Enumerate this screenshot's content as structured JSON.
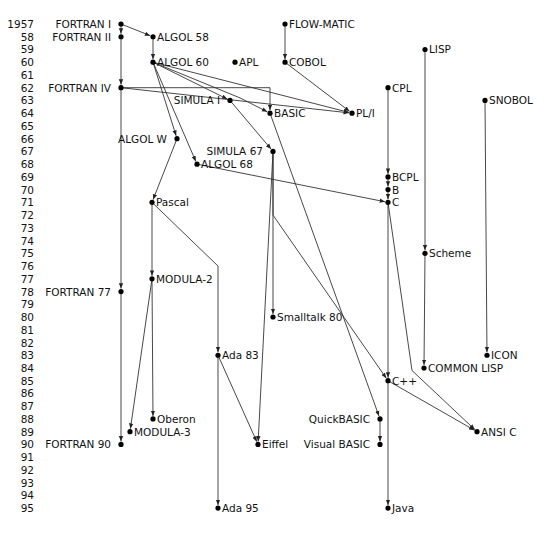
{
  "years": [
    "1957",
    "58",
    "59",
    "60",
    "61",
    "62",
    "63",
    "64",
    "65",
    "66",
    "67",
    "68",
    "69",
    "70",
    "71",
    "72",
    "73",
    "74",
    "75",
    "76",
    "77",
    "78",
    "79",
    "80",
    "81",
    "82",
    "83",
    "84",
    "85",
    "86",
    "87",
    "88",
    "89",
    "90",
    "91",
    "92",
    "93",
    "94",
    "95"
  ],
  "languages": [
    {
      "id": "fortran1",
      "name": "FORTRAN I",
      "year": 1957,
      "label_side": "left"
    },
    {
      "id": "fortran2",
      "name": "FORTRAN II",
      "year": 1958,
      "label_side": "left"
    },
    {
      "id": "algol58",
      "name": "ALGOL 58",
      "year": 1958,
      "label_side": "right"
    },
    {
      "id": "flowmatic",
      "name": "FLOW-MATIC",
      "year": 1957,
      "label_side": "right"
    },
    {
      "id": "lisp",
      "name": "LISP",
      "year": 1959,
      "label_side": "right"
    },
    {
      "id": "algol60",
      "name": "ALGOL 60",
      "year": 1960,
      "label_side": "right"
    },
    {
      "id": "apl",
      "name": "APL",
      "year": 1960,
      "label_side": "right"
    },
    {
      "id": "cobol",
      "name": "COBOL",
      "year": 1960,
      "label_side": "right"
    },
    {
      "id": "fortran4",
      "name": "FORTRAN IV",
      "year": 1962,
      "label_side": "left"
    },
    {
      "id": "cpl",
      "name": "CPL",
      "year": 1962,
      "label_side": "right"
    },
    {
      "id": "simula1",
      "name": "SIMULA I",
      "year": 1963,
      "label_side": "left"
    },
    {
      "id": "snobol",
      "name": "SNOBOL",
      "year": 1963,
      "label_side": "right"
    },
    {
      "id": "basic",
      "name": "BASIC",
      "year": 1964,
      "label_side": "right"
    },
    {
      "id": "pl1",
      "name": "PL/I",
      "year": 1964,
      "label_side": "right"
    },
    {
      "id": "algolw",
      "name": "ALGOL W",
      "year": 1966,
      "label_side": "left"
    },
    {
      "id": "simula67",
      "name": "SIMULA 67",
      "year": 1967,
      "label_side": "left"
    },
    {
      "id": "algol68",
      "name": "ALGOL 68",
      "year": 1968,
      "label_side": "right"
    },
    {
      "id": "bcpl",
      "name": "BCPL",
      "year": 1969,
      "label_side": "right"
    },
    {
      "id": "b",
      "name": "B",
      "year": 1970,
      "label_side": "right"
    },
    {
      "id": "c",
      "name": "C",
      "year": 1971,
      "label_side": "right"
    },
    {
      "id": "pascal",
      "name": "Pascal",
      "year": 1971,
      "label_side": "right"
    },
    {
      "id": "scheme",
      "name": "Scheme",
      "year": 1975,
      "label_side": "right"
    },
    {
      "id": "modula2",
      "name": "MODULA-2",
      "year": 1977,
      "label_side": "right"
    },
    {
      "id": "fortran77",
      "name": "FORTRAN 77",
      "year": 1978,
      "label_side": "left"
    },
    {
      "id": "smalltalk80",
      "name": "Smalltalk 80",
      "year": 1980,
      "label_side": "right"
    },
    {
      "id": "ada83",
      "name": "Ada 83",
      "year": 1983,
      "label_side": "right"
    },
    {
      "id": "icon",
      "name": "ICON",
      "year": 1983,
      "label_side": "right"
    },
    {
      "id": "commonlisp",
      "name": "COMMON LISP",
      "year": 1984,
      "label_side": "right"
    },
    {
      "id": "cpp",
      "name": "C++",
      "year": 1985,
      "label_side": "right"
    },
    {
      "id": "oberon",
      "name": "Oberon",
      "year": 1988,
      "label_side": "right"
    },
    {
      "id": "quickbasic",
      "name": "QuickBASIC",
      "year": 1988,
      "label_side": "left"
    },
    {
      "id": "modula3",
      "name": "MODULA-3",
      "year": 1989,
      "label_side": "right"
    },
    {
      "id": "ansic",
      "name": "ANSI C",
      "year": 1989,
      "label_side": "right"
    },
    {
      "id": "fortran90",
      "name": "FORTRAN 90",
      "year": 1990,
      "label_side": "left"
    },
    {
      "id": "eiffel",
      "name": "Eiffel",
      "year": 1990,
      "label_side": "right"
    },
    {
      "id": "visualbasic",
      "name": "Visual BASIC",
      "year": 1990,
      "label_side": "left"
    },
    {
      "id": "ada95",
      "name": "Ada 95",
      "year": 1995,
      "label_side": "right"
    },
    {
      "id": "java",
      "name": "Java",
      "year": 1995,
      "label_side": "right"
    }
  ],
  "influences": [
    [
      "fortran1",
      "fortran2"
    ],
    [
      "fortran1",
      "algol58"
    ],
    [
      "fortran2",
      "fortran4"
    ],
    [
      "algol58",
      "algol60"
    ],
    [
      "flowmatic",
      "cobol"
    ],
    [
      "fortran4",
      "pl1"
    ],
    [
      "algol60",
      "pl1"
    ],
    [
      "cobol",
      "pl1"
    ],
    [
      "algol60",
      "simula1"
    ],
    [
      "algol60",
      "basic"
    ],
    [
      "fortran4",
      "basic"
    ],
    [
      "algol60",
      "algolw"
    ],
    [
      "algol60",
      "algol68"
    ],
    [
      "simula1",
      "simula67"
    ],
    [
      "cpl",
      "bcpl"
    ],
    [
      "bcpl",
      "b"
    ],
    [
      "b",
      "c"
    ],
    [
      "algol68",
      "c"
    ],
    [
      "algolw",
      "pascal"
    ],
    [
      "lisp",
      "scheme"
    ],
    [
      "pascal",
      "modula2"
    ],
    [
      "fortran4",
      "fortran77"
    ],
    [
      "simula67",
      "smalltalk80"
    ],
    [
      "pascal",
      "ada83"
    ],
    [
      "snobol",
      "icon"
    ],
    [
      "scheme",
      "commonlisp"
    ],
    [
      "c",
      "cpp"
    ],
    [
      "simula67",
      "cpp"
    ],
    [
      "modula2",
      "oberon"
    ],
    [
      "basic",
      "quickbasic"
    ],
    [
      "modula2",
      "modula3"
    ],
    [
      "c",
      "ansic"
    ],
    [
      "cpp",
      "ansic"
    ],
    [
      "fortran77",
      "fortran90"
    ],
    [
      "simula67",
      "eiffel"
    ],
    [
      "ada83",
      "eiffel"
    ],
    [
      "quickbasic",
      "visualbasic"
    ],
    [
      "ada83",
      "ada95"
    ],
    [
      "cpp",
      "java"
    ]
  ]
}
